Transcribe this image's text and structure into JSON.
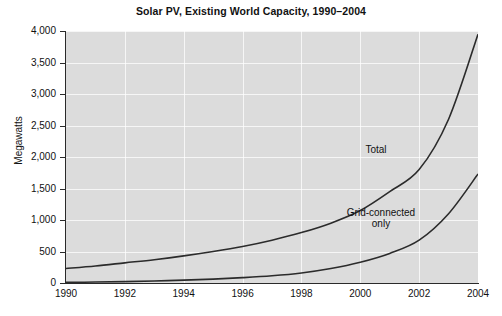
{
  "chart_data": {
    "type": "line",
    "title": "Solar PV, Existing World Capacity, 1990–2004",
    "xlabel": "",
    "ylabel": "Megawatts",
    "xlim": [
      1990,
      2004
    ],
    "ylim": [
      0,
      4000
    ],
    "grid": true,
    "legend_position": "inline-annotation",
    "x_ticks": [
      "1990",
      "1992",
      "1994",
      "1996",
      "1998",
      "2000",
      "2002",
      "2004"
    ],
    "y_ticks": [
      "0",
      "500",
      "1,000",
      "1,500",
      "2,000",
      "2,500",
      "3,000",
      "3,500",
      "4,000"
    ],
    "x": [
      1990,
      1991,
      1992,
      1993,
      1994,
      1995,
      1996,
      1997,
      1998,
      1999,
      2000,
      2001,
      2002,
      2003,
      2004
    ],
    "series": [
      {
        "name": "Total",
        "values": [
          230,
          270,
          320,
          370,
          430,
          500,
          580,
          680,
          800,
          950,
          1150,
          1450,
          1800,
          2600,
          3950
        ]
      },
      {
        "name": "Grid-connected only",
        "values": [
          10,
          15,
          22,
          32,
          45,
          62,
          85,
          115,
          160,
          230,
          330,
          470,
          680,
          1100,
          1730
        ]
      }
    ],
    "annotations": [
      {
        "text": "Total",
        "x": 2001,
        "y": 2050
      },
      {
        "text": "Grid-connected\nonly",
        "x": 2000.4,
        "y": 1130
      }
    ],
    "colors": {
      "plot_background": "#dcdcdc",
      "gridline": "#ffffff",
      "line": "#2b2b2b",
      "axis": "#2a2a2a",
      "text": "#111111",
      "page_background": "#ffffff"
    }
  },
  "labels": {
    "series_total": "Total",
    "series_grid_line1": "Grid-connected",
    "series_grid_line2": "only"
  }
}
